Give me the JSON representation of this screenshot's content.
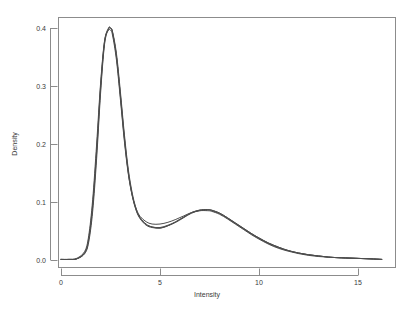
{
  "chart_data": {
    "type": "line",
    "title": "",
    "subtitle": "",
    "xlabel": "Intensity",
    "ylabel": "Density",
    "xlim": [
      -0.8,
      16.8
    ],
    "ylim": [
      -0.008,
      0.418
    ],
    "xticks": [
      0,
      5,
      10,
      15
    ],
    "xtick_labels": [
      "0",
      "5",
      "10",
      "15"
    ],
    "yticks": [
      0.0,
      0.1,
      0.2,
      0.3,
      0.4
    ],
    "ytick_labels": [
      "0.0",
      "0.1",
      "0.2",
      "0.3",
      "0.4"
    ],
    "grid": false,
    "legend": "none",
    "frame": true,
    "curve_color": "#4d4d4d",
    "axis_color": "#8c8c8c",
    "text_color": "#3a3a3a",
    "background": "#ffffff",
    "x": [
      0.0,
      0.4,
      0.8,
      1.2,
      1.4,
      1.6,
      1.8,
      2.0,
      2.2,
      2.4,
      2.5,
      2.6,
      2.8,
      3.0,
      3.2,
      3.4,
      3.6,
      3.8,
      4.0,
      4.3,
      4.6,
      5.0,
      5.4,
      5.8,
      6.2,
      6.6,
      7.0,
      7.4,
      7.6,
      8.0,
      8.4,
      8.8,
      9.2,
      9.6,
      10.0,
      10.5,
      11.0,
      11.5,
      12.0,
      12.5,
      13.0,
      13.5,
      14.0,
      14.8,
      15.6,
      16.2
    ],
    "series": [
      {
        "name": "curve-1",
        "values": [
          0.001,
          0.001,
          0.002,
          0.012,
          0.035,
          0.092,
          0.185,
          0.295,
          0.375,
          0.399,
          0.4,
          0.393,
          0.352,
          0.285,
          0.212,
          0.152,
          0.112,
          0.086,
          0.072,
          0.061,
          0.057,
          0.056,
          0.06,
          0.066,
          0.074,
          0.081,
          0.085,
          0.086,
          0.085,
          0.08,
          0.072,
          0.063,
          0.054,
          0.045,
          0.037,
          0.028,
          0.021,
          0.016,
          0.012,
          0.009,
          0.007,
          0.005,
          0.004,
          0.003,
          0.002,
          0.001
        ]
      },
      {
        "name": "curve-2",
        "values": [
          0.001,
          0.001,
          0.002,
          0.011,
          0.031,
          0.084,
          0.175,
          0.288,
          0.372,
          0.398,
          0.399,
          0.394,
          0.356,
          0.29,
          0.217,
          0.156,
          0.115,
          0.088,
          0.073,
          0.062,
          0.057,
          0.055,
          0.059,
          0.065,
          0.073,
          0.081,
          0.086,
          0.087,
          0.086,
          0.081,
          0.073,
          0.064,
          0.055,
          0.046,
          0.038,
          0.029,
          0.022,
          0.016,
          0.012,
          0.009,
          0.007,
          0.005,
          0.004,
          0.003,
          0.002,
          0.001
        ]
      },
      {
        "name": "curve-3",
        "values": [
          0.001,
          0.001,
          0.003,
          0.015,
          0.042,
          0.104,
          0.2,
          0.305,
          0.378,
          0.396,
          0.396,
          0.388,
          0.345,
          0.277,
          0.205,
          0.148,
          0.111,
          0.088,
          0.075,
          0.066,
          0.062,
          0.062,
          0.065,
          0.07,
          0.076,
          0.082,
          0.085,
          0.085,
          0.084,
          0.079,
          0.071,
          0.062,
          0.053,
          0.044,
          0.036,
          0.027,
          0.02,
          0.015,
          0.011,
          0.008,
          0.006,
          0.005,
          0.004,
          0.003,
          0.002,
          0.001
        ]
      },
      {
        "name": "curve-4",
        "values": [
          0.001,
          0.001,
          0.002,
          0.013,
          0.037,
          0.096,
          0.19,
          0.3,
          0.377,
          0.4,
          0.4,
          0.392,
          0.35,
          0.282,
          0.209,
          0.15,
          0.11,
          0.085,
          0.071,
          0.06,
          0.056,
          0.055,
          0.059,
          0.066,
          0.074,
          0.082,
          0.086,
          0.087,
          0.086,
          0.081,
          0.073,
          0.064,
          0.055,
          0.046,
          0.038,
          0.029,
          0.022,
          0.016,
          0.012,
          0.009,
          0.007,
          0.005,
          0.004,
          0.003,
          0.002,
          0.001
        ]
      }
    ]
  }
}
